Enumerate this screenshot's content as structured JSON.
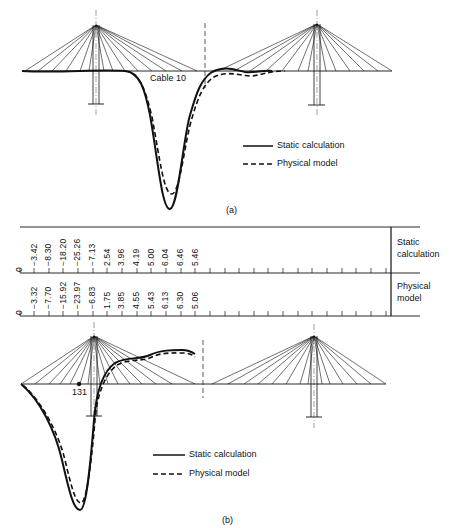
{
  "panel_a": {
    "caption": "(a)",
    "cable_label": "Cable 10",
    "legend": [
      {
        "label": "Static calculation",
        "style": "solid"
      },
      {
        "label": "Physical model",
        "style": "dashed"
      }
    ]
  },
  "table": {
    "rows": [
      {
        "label_line1": "Static",
        "label_line2": "calculation",
        "values": [
          "0",
          "−3.42",
          "−8.30",
          "−18.20",
          "−25.26",
          "−7.13",
          "2.54",
          "3.96",
          "4.19",
          "5.00",
          "6.04",
          "6.46",
          "5.46"
        ]
      },
      {
        "label_line1": "Physical",
        "label_line2": "model",
        "values": [
          "0",
          "−3.32",
          "−7.70",
          "−15.92",
          "−23.97",
          "−6.83",
          "1.75",
          "3.85",
          "4.55",
          "5.43",
          "6.13",
          "6.30",
          "5.06"
        ]
      }
    ]
  },
  "panel_b": {
    "caption": "(b)",
    "point_label": "131",
    "legend": [
      {
        "label": "Static calculation",
        "style": "solid"
      },
      {
        "label": "Physical model",
        "style": "dashed"
      }
    ]
  }
}
